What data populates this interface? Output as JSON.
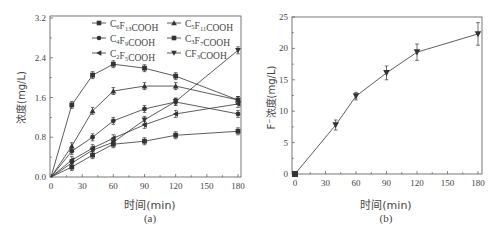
{
  "chart_data": [
    {
      "panel": "(a)",
      "type": "line",
      "title": "",
      "xlabel": "时间(min)",
      "ylabel": "浓度(mg/L)",
      "xlim": [
        0,
        185
      ],
      "ylim": [
        0,
        3.2
      ],
      "xticks": [
        0,
        30,
        60,
        90,
        120,
        150,
        180
      ],
      "yticks": [
        0.0,
        0.8,
        1.6,
        2.4,
        3.2
      ],
      "ytick_labels": [
        "0.0",
        "0.8",
        "1.6",
        "2.4",
        "3.2"
      ],
      "grid": false,
      "legend_position": "top, inside, 2 columns",
      "x": [
        0,
        20,
        40,
        60,
        90,
        120,
        180
      ],
      "series": [
        {
          "name": "C6F13COOH",
          "label_main": "C",
          "sub1": "6",
          "mid": "F",
          "sub2": "13",
          "tail": "COOH",
          "marker": "square",
          "values": [
            0,
            1.45,
            2.05,
            2.27,
            2.19,
            2.03,
            1.55
          ]
        },
        {
          "name": "C5F11COOH",
          "label_main": "C",
          "sub1": "5",
          "mid": "F",
          "sub2": "11",
          "tail": "COOH",
          "marker": "triangle-up",
          "values": [
            0,
            0.62,
            1.33,
            1.73,
            1.83,
            1.83,
            1.55
          ]
        },
        {
          "name": "C4F9COOH",
          "label_main": "C",
          "sub1": "4",
          "mid": "F",
          "sub2": "9",
          "tail": "COOH",
          "marker": "circle",
          "values": [
            0,
            0.52,
            0.8,
            1.13,
            1.37,
            1.51,
            1.27
          ]
        },
        {
          "name": "C3F7COOH",
          "label_main": "C",
          "sub1": "3",
          "mid": "F",
          "sub2": "7",
          "tail": "COOH",
          "marker": "square",
          "values": [
            0,
            0.2,
            0.44,
            0.66,
            0.72,
            0.84,
            0.92
          ]
        },
        {
          "name": "C2F5COOH",
          "label_main": "C",
          "sub1": "2",
          "mid": "F",
          "sub2": "5",
          "tail": "COOH",
          "marker": "triangle-left",
          "values": [
            0,
            0.34,
            0.58,
            0.78,
            1.05,
            1.27,
            1.47
          ]
        },
        {
          "name": "CF3COOH",
          "label_main": "C",
          "sub1": "",
          "mid": "F",
          "sub2": "3",
          "tail": "COOH",
          "marker": "triangle-down",
          "values": [
            0,
            0.28,
            0.54,
            0.7,
            1.15,
            1.52,
            2.55
          ]
        }
      ],
      "error_bars": true
    },
    {
      "panel": "(b)",
      "type": "line",
      "title": "",
      "xlabel": "时间(min)",
      "ylabel": "F⁻浓度(mg/L)",
      "xlim": [
        0,
        185
      ],
      "ylim": [
        0,
        25
      ],
      "xticks": [
        0,
        30,
        60,
        90,
        120,
        150,
        180
      ],
      "yticks": [
        0,
        5,
        10,
        15,
        20,
        25
      ],
      "ytick_labels": [
        "0",
        "5",
        "10",
        "15",
        "20",
        "25"
      ],
      "grid": false,
      "x": [
        0,
        40,
        60,
        90,
        120,
        180
      ],
      "series": [
        {
          "name": "F-",
          "marker": "triangle-down",
          "values": [
            0,
            7.8,
            12.4,
            16.1,
            19.4,
            22.3
          ],
          "errors": [
            0,
            0.8,
            0.6,
            1.1,
            1.3,
            1.8
          ]
        }
      ],
      "error_bars": true
    }
  ],
  "captions": {
    "a": "(a)",
    "b": "(b)"
  },
  "colors": {
    "line": "#333333",
    "axis": "#555555",
    "text": "#444444"
  }
}
